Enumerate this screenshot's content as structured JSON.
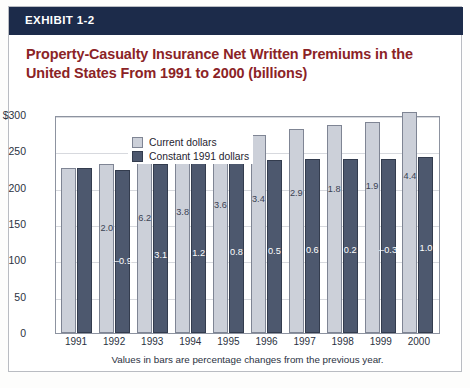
{
  "exhibit": {
    "label": "EXHIBIT 1-2"
  },
  "title": "Property-Casualty Insurance Net Written Premiums in the United States From 1991 to 2000 (billions)",
  "footnote": "Values in bars are percentage changes from the previous year.",
  "colors": {
    "header_band": "#1c2b4a",
    "title_text": "#8b2326",
    "current_dollars_bar": "#ccd0d9",
    "constant_dollars_bar": "#4d586e",
    "frame_border": "#b9bcc2",
    "gridline": "#d7d9de"
  },
  "legend": {
    "items": [
      {
        "label": "Current dollars",
        "color": "#ccd0d9"
      },
      {
        "label": "Constant 1991 dollars",
        "color": "#4d586e"
      }
    ]
  },
  "axis": {
    "y_ticks": [
      "$300",
      "250",
      "200",
      "150",
      "100",
      "50",
      "0"
    ],
    "y_tick_values": [
      300,
      250,
      200,
      150,
      100,
      50,
      0
    ]
  },
  "chart_data": {
    "type": "bar",
    "title": "Property-Casualty Insurance Net Written Premiums in the United States From 1991 to 2000 (billions)",
    "xlabel": "",
    "ylabel": "",
    "ylim": [
      0,
      300
    ],
    "grid": true,
    "legend_position": "top-left-inside",
    "categories": [
      "1991",
      "1992",
      "1993",
      "1994",
      "1995",
      "1996",
      "1997",
      "1998",
      "1999",
      "2000"
    ],
    "series": [
      {
        "name": "Current dollars",
        "color": "#ccd0d9",
        "values": [
          227,
          232,
          246,
          255,
          264,
          273,
          281,
          286,
          291,
          304
        ],
        "data_labels": [
          "",
          "2.0",
          "6.2",
          "3.8",
          "3.6",
          "3.4",
          "2.9",
          "1.8",
          "1.9",
          "4.4"
        ]
      },
      {
        "name": "Constant 1991 dollars",
        "color": "#4d586e",
        "values": [
          227,
          225,
          232,
          235,
          237,
          238,
          240,
          240,
          239,
          242
        ],
        "data_labels": [
          "",
          "–0.9",
          "3.1",
          "1.2",
          "0.8",
          "0.5",
          "0.6",
          "0.2",
          "–0.3",
          "1.0"
        ]
      }
    ],
    "annotation": "Values in bars are percentage changes from the previous year."
  }
}
